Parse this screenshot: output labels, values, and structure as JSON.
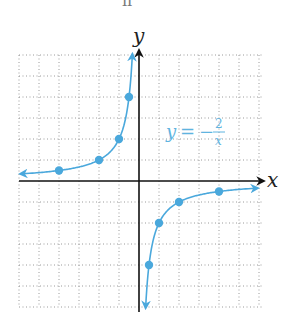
{
  "chart_data": {
    "type": "line",
    "title": "",
    "function": "y = -2/x",
    "xlabel": "x",
    "ylabel": "y",
    "xlim": [
      -6,
      6
    ],
    "ylim": [
      -6,
      6
    ],
    "grid": true,
    "grid_style": "dotted",
    "legend": null,
    "annotations": [
      {
        "text_lhs": "y",
        "text_eq": "=",
        "text_sign": "−",
        "numerator": "2",
        "denominator": "x",
        "position": [
          1.3,
          2.2
        ]
      }
    ],
    "series": [
      {
        "name": "y = -2/x (x < 0)",
        "color": "#4aa8dc",
        "points": [
          [
            -4,
            0.5
          ],
          [
            -2,
            1
          ],
          [
            -1,
            2
          ],
          [
            -0.5,
            4
          ]
        ],
        "arrows": [
          "left",
          "up"
        ]
      },
      {
        "name": "y = -2/x (x > 0)",
        "color": "#4aa8dc",
        "points": [
          [
            0.5,
            -4
          ],
          [
            1,
            -2
          ],
          [
            2,
            -1
          ],
          [
            4,
            -0.5
          ]
        ],
        "arrows": [
          "down",
          "right"
        ]
      }
    ]
  },
  "labels": {
    "x_axis": "x",
    "y_axis": "y",
    "eq_y": "y",
    "eq_equals": "=",
    "eq_minus": "−",
    "eq_num": "2",
    "eq_den": "x",
    "top_cropped": "ıı"
  },
  "colors": {
    "curve": "#4aa8dc",
    "axis": "#111111",
    "grid": "#9a9a9a"
  }
}
